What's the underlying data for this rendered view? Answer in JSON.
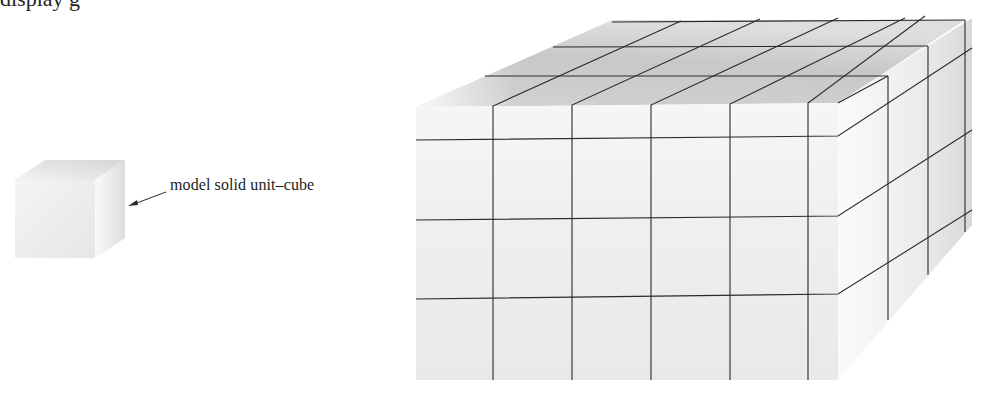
{
  "figure": {
    "top_caption_fragment": "display g",
    "small_cube": {
      "label": "model solid unit–cube",
      "arrow": "arrow-pointing-to-cube"
    },
    "large_cube": {
      "description": "solid block subdivided into a 5 × 3 × 3 grid of unit cubes",
      "front_columns": 5,
      "front_rows": 3,
      "depth_layers": 3
    },
    "colors": {
      "line": "#2a2a2a",
      "front_face": "#ededed",
      "top_face": "#c9c9c9",
      "side_face": "#e2e2e2",
      "background": "#ffffff"
    }
  }
}
